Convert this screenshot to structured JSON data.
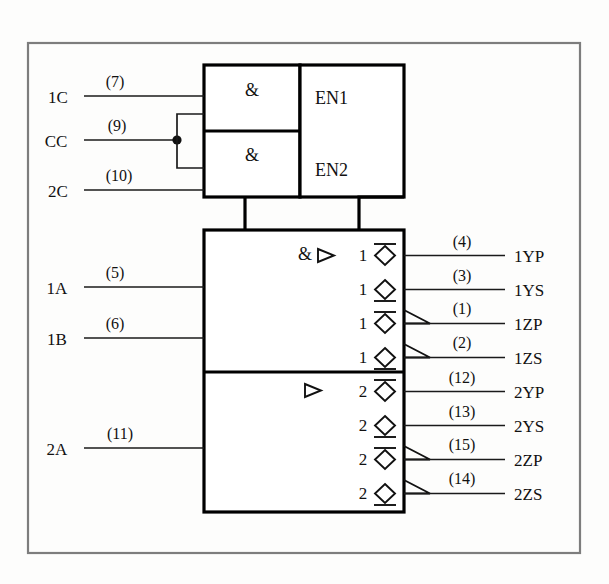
{
  "figure": {
    "background_color": "#fdfdfc",
    "line_color": "#000000",
    "frame_color": "#7d7d7d"
  },
  "enable_block": {
    "gate1_symbol": "&",
    "gate2_symbol": "&",
    "output1_label": "EN1",
    "output2_label": "EN2",
    "inputs": [
      {
        "name": "1C",
        "pin": "(7)"
      },
      {
        "name": "CC",
        "pin": "(9)"
      },
      {
        "name": "2C",
        "pin": "(10)"
      }
    ]
  },
  "main_block": {
    "upper": {
      "qualifier_and": "&",
      "qualifier_amp": "▷",
      "group": "1",
      "inputs": [
        {
          "name": "1A",
          "pin": "(5)"
        },
        {
          "name": "1B",
          "pin": "(6)"
        }
      ],
      "outputs": [
        {
          "name": "1YP",
          "pin": "(4)",
          "group": "1",
          "bar": "top",
          "open_collector": false
        },
        {
          "name": "1YS",
          "pin": "(3)",
          "group": "1",
          "bar": "bottom",
          "open_collector": false
        },
        {
          "name": "1ZP",
          "pin": "(1)",
          "group": "1",
          "bar": "top",
          "open_collector": true
        },
        {
          "name": "1ZS",
          "pin": "(2)",
          "group": "1",
          "bar": "bottom",
          "open_collector": true
        }
      ]
    },
    "lower": {
      "qualifier_amp": "▷",
      "group": "2",
      "inputs": [
        {
          "name": "2A",
          "pin": "(11)"
        }
      ],
      "outputs": [
        {
          "name": "2YP",
          "pin": "(12)",
          "group": "2",
          "bar": "top",
          "open_collector": false
        },
        {
          "name": "2YS",
          "pin": "(13)",
          "group": "2",
          "bar": "bottom",
          "open_collector": false
        },
        {
          "name": "2ZP",
          "pin": "(15)",
          "group": "2",
          "bar": "top",
          "open_collector": true
        },
        {
          "name": "2ZS",
          "pin": "(14)",
          "group": "2",
          "bar": "bottom",
          "open_collector": true
        }
      ]
    }
  }
}
